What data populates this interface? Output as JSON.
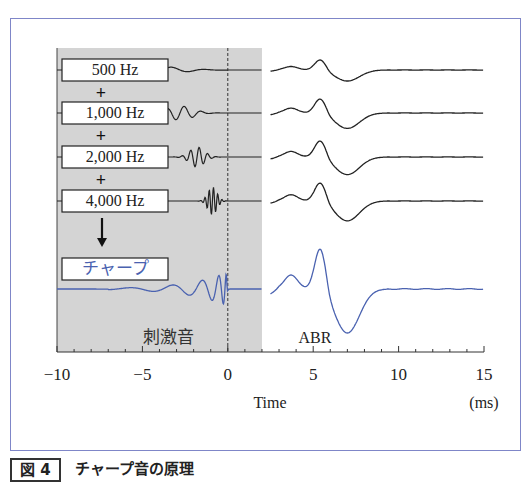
{
  "figure": {
    "caption_number": "図 4",
    "caption_title": "チャープ音の原理",
    "stimulus_region_label": "刺激音",
    "response_label": "ABR",
    "plus_symbol": "+"
  },
  "chart_data": {
    "type": "line",
    "title": "チャープ音の原理",
    "xlabel": "Time",
    "xunit": "(ms)",
    "xlim": [
      -10,
      15
    ],
    "xticks": [
      -10,
      -5,
      0,
      5,
      10,
      15
    ],
    "xtick_labels": [
      "−10",
      "−5",
      "0",
      "5",
      "10",
      "15"
    ],
    "minor_tick_step": 1,
    "grid": false,
    "shaded_region": {
      "from": -10,
      "to": 2,
      "label": "刺激音",
      "color": "#d4d4d4"
    },
    "reference_line": {
      "x": 0,
      "style": "dashed"
    },
    "series": [
      {
        "name": "500 Hz",
        "color": "#222222",
        "stimulus_center_ms": -3.8,
        "stimulus_freq_khz": 0.5,
        "abr_wave_v_ms": 5.4,
        "abr_amp": 0.45
      },
      {
        "name": "1,000 Hz",
        "color": "#222222",
        "stimulus_center_ms": -2.8,
        "stimulus_freq_khz": 1.0,
        "abr_wave_v_ms": 5.4,
        "abr_amp": 0.6
      },
      {
        "name": "2,000 Hz",
        "color": "#222222",
        "stimulus_center_ms": -1.8,
        "stimulus_freq_khz": 2.0,
        "abr_wave_v_ms": 5.4,
        "abr_amp": 0.75
      },
      {
        "name": "4,000 Hz",
        "color": "#222222",
        "stimulus_center_ms": -0.9,
        "stimulus_freq_khz": 4.0,
        "abr_wave_v_ms": 5.4,
        "abr_amp": 0.85
      },
      {
        "name": "チャープ",
        "color": "#4a62b0",
        "stimulus_center_ms": -1.5,
        "stimulus_freq_khz": "sweep",
        "abr_wave_v_ms": 5.4,
        "abr_amp": 2.0
      }
    ]
  }
}
